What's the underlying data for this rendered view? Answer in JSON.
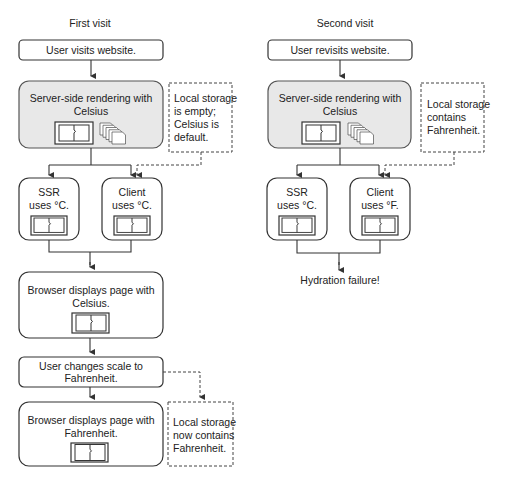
{
  "first_visit": {
    "title": "First visit",
    "start": "User visits website.",
    "ssr": {
      "line1": "Server-side rendering with",
      "line2": "Celsius"
    },
    "storage_note": {
      "line1": "Local storage",
      "line2": "is empty;",
      "line3": "Celsius is",
      "line4": "default."
    },
    "ssr_box": {
      "line1": "SSR",
      "line2": "uses °C."
    },
    "client_box": {
      "line1": "Client",
      "line2": "uses °C."
    },
    "browser_celsius": {
      "line1": "Browser displays page with",
      "line2": "Celsius."
    },
    "change_scale": {
      "line1": "User changes scale to",
      "line2": "Fahrenheit."
    },
    "browser_fahrenheit": {
      "line1": "Browser displays page with",
      "line2": "Fahrenheit."
    },
    "storage_note2": {
      "line1": "Local storage",
      "line2": "now contains",
      "line3": "Fahrenheit."
    }
  },
  "second_visit": {
    "title": "Second visit",
    "start": "User revisits website.",
    "ssr": {
      "line1": "Server-side rendering with",
      "line2": "Celsius"
    },
    "storage_note": {
      "line1": "Local storage",
      "line2": "contains",
      "line3": "Fahrenheit."
    },
    "ssr_box": {
      "line1": "SSR",
      "line2": "uses °C."
    },
    "client_box": {
      "line1": "Client",
      "line2": "uses °F."
    },
    "result": "Hydration failure!"
  },
  "icons": {
    "page": "page-component-icon",
    "stack": "stacked-pages-icon"
  }
}
